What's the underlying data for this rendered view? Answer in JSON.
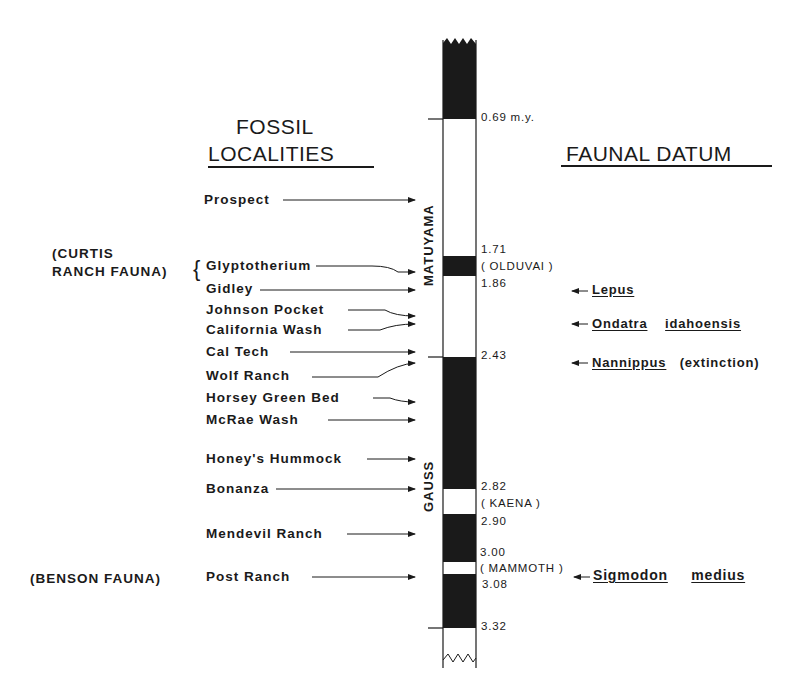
{
  "headings": {
    "left_line1": "FOSSIL",
    "left_line2": "LOCALITIES",
    "right": "FAUNAL DATUM"
  },
  "fauna_groups": {
    "curtis_line1": "(CURTIS",
    "curtis_line2": "RANCH FAUNA)",
    "curtis_brace": "{",
    "benson": "(BENSON FAUNA)"
  },
  "localities": [
    {
      "name": "Prospect"
    },
    {
      "name": "Glyptotherium"
    },
    {
      "name": "Gidley"
    },
    {
      "name": "Johnson Pocket"
    },
    {
      "name": "California Wash"
    },
    {
      "name": "Cal Tech"
    },
    {
      "name": "Wolf Ranch"
    },
    {
      "name": "Horsey Green Bed"
    },
    {
      "name": "McRae Wash"
    },
    {
      "name": "Honey's Hummock"
    },
    {
      "name": "Bonanza"
    },
    {
      "name": "Mendevil Ranch"
    },
    {
      "name": "Post Ranch"
    }
  ],
  "epochs": {
    "matuyama": "MATUYAMA",
    "gauss": "GAUSS"
  },
  "ages": {
    "a069": "0.69 m.y.",
    "a171": "1.71",
    "olduvai": "( OLDUVAI )",
    "a186": "1.86",
    "a243": "2.43",
    "a282": "2.82",
    "kaena": "( KAENA )",
    "a290": "2.90",
    "a300": "3.00",
    "mammoth": "( MAMMOTH )",
    "a308": "3.08",
    "a332": "3.32"
  },
  "faunal_datums": [
    {
      "taxon": "Lepus",
      "note": ""
    },
    {
      "taxon": "Ondatra",
      "taxon2": "idahoensis",
      "note": ""
    },
    {
      "taxon": "Nannippus",
      "note": "(extinction)"
    },
    {
      "taxon": "Sigmodon",
      "taxon2": "medius",
      "note": ""
    }
  ],
  "colors": {
    "ink": "#1a1a1a",
    "background": "#ffffff"
  }
}
